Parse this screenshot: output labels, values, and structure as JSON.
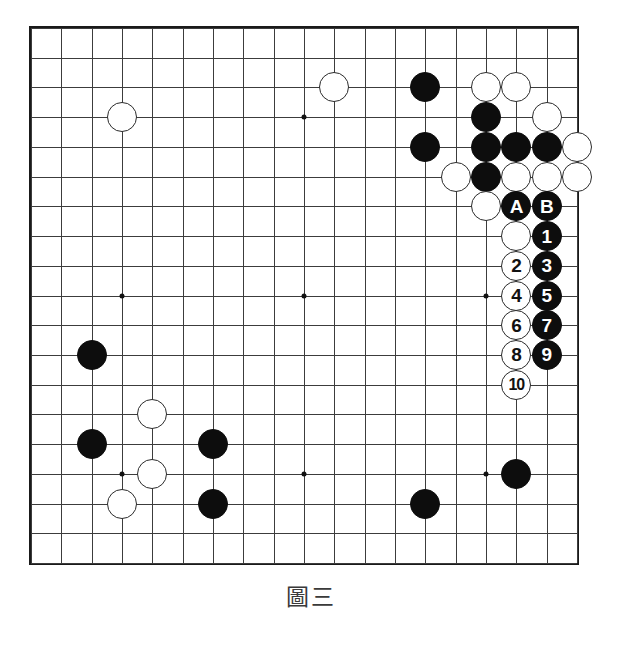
{
  "figure": {
    "caption": "圖三",
    "type": "go-game-diagram"
  },
  "board": {
    "size": 19,
    "line_color": "#3c3c3c",
    "border_color": "#1a1a1a",
    "background": "#ffffff",
    "star_points": [
      {
        "col": 3,
        "row": 3
      },
      {
        "col": 9,
        "row": 3
      },
      {
        "col": 15,
        "row": 3
      },
      {
        "col": 3,
        "row": 9
      },
      {
        "col": 9,
        "row": 9
      },
      {
        "col": 15,
        "row": 9
      },
      {
        "col": 3,
        "row": 15
      },
      {
        "col": 9,
        "row": 15
      },
      {
        "col": 15,
        "row": 15
      }
    ]
  },
  "colors": {
    "black_stone": "#0d0d0d",
    "white_stone": "#ffffff",
    "white_stone_border": "#2b2b2b",
    "black_label_text": "#ffffff",
    "white_label_text": "#111111"
  },
  "stones": [
    {
      "col": 3,
      "row": 3,
      "color": "white",
      "label": ""
    },
    {
      "col": 10,
      "row": 2,
      "color": "white",
      "label": ""
    },
    {
      "col": 13,
      "row": 2,
      "color": "black",
      "label": ""
    },
    {
      "col": 15,
      "row": 2,
      "color": "white",
      "label": ""
    },
    {
      "col": 16,
      "row": 2,
      "color": "white",
      "label": ""
    },
    {
      "col": 15,
      "row": 3,
      "color": "black",
      "label": ""
    },
    {
      "col": 17,
      "row": 3,
      "color": "white",
      "label": ""
    },
    {
      "col": 13,
      "row": 4,
      "color": "black",
      "label": ""
    },
    {
      "col": 15,
      "row": 4,
      "color": "black",
      "label": ""
    },
    {
      "col": 16,
      "row": 4,
      "color": "black",
      "label": ""
    },
    {
      "col": 17,
      "row": 4,
      "color": "black",
      "label": ""
    },
    {
      "col": 18,
      "row": 4,
      "color": "white",
      "label": ""
    },
    {
      "col": 14,
      "row": 5,
      "color": "white",
      "label": ""
    },
    {
      "col": 15,
      "row": 5,
      "color": "black",
      "label": ""
    },
    {
      "col": 16,
      "row": 5,
      "color": "white",
      "label": ""
    },
    {
      "col": 17,
      "row": 5,
      "color": "white",
      "label": ""
    },
    {
      "col": 18,
      "row": 5,
      "color": "white",
      "label": ""
    },
    {
      "col": 15,
      "row": 6,
      "color": "white",
      "label": ""
    },
    {
      "col": 16,
      "row": 6,
      "color": "black",
      "label": "A"
    },
    {
      "col": 17,
      "row": 6,
      "color": "black",
      "label": "B"
    },
    {
      "col": 16,
      "row": 7,
      "color": "white",
      "label": ""
    },
    {
      "col": 17,
      "row": 7,
      "color": "black",
      "label": "1"
    },
    {
      "col": 16,
      "row": 8,
      "color": "white",
      "label": "2"
    },
    {
      "col": 17,
      "row": 8,
      "color": "black",
      "label": "3"
    },
    {
      "col": 16,
      "row": 9,
      "color": "white",
      "label": "4"
    },
    {
      "col": 17,
      "row": 9,
      "color": "black",
      "label": "5"
    },
    {
      "col": 16,
      "row": 10,
      "color": "white",
      "label": "6"
    },
    {
      "col": 17,
      "row": 10,
      "color": "black",
      "label": "7"
    },
    {
      "col": 16,
      "row": 11,
      "color": "white",
      "label": "8"
    },
    {
      "col": 17,
      "row": 11,
      "color": "black",
      "label": "9"
    },
    {
      "col": 16,
      "row": 12,
      "color": "white",
      "label": "10"
    },
    {
      "col": 2,
      "row": 11,
      "color": "black",
      "label": ""
    },
    {
      "col": 4,
      "row": 13,
      "color": "white",
      "label": ""
    },
    {
      "col": 2,
      "row": 14,
      "color": "black",
      "label": ""
    },
    {
      "col": 6,
      "row": 14,
      "color": "black",
      "label": ""
    },
    {
      "col": 4,
      "row": 15,
      "color": "white",
      "label": ""
    },
    {
      "col": 16,
      "row": 15,
      "color": "black",
      "label": ""
    },
    {
      "col": 3,
      "row": 16,
      "color": "white",
      "label": ""
    },
    {
      "col": 6,
      "row": 16,
      "color": "black",
      "label": ""
    },
    {
      "col": 13,
      "row": 16,
      "color": "black",
      "label": ""
    }
  ],
  "move_sequence": {
    "markers": [
      "A",
      "B"
    ],
    "numbers": [
      "1",
      "2",
      "3",
      "4",
      "5",
      "6",
      "7",
      "8",
      "9",
      "10"
    ],
    "black_moves": [
      "1",
      "3",
      "5",
      "7",
      "9"
    ],
    "white_moves": [
      "2",
      "4",
      "6",
      "8",
      "10"
    ]
  }
}
